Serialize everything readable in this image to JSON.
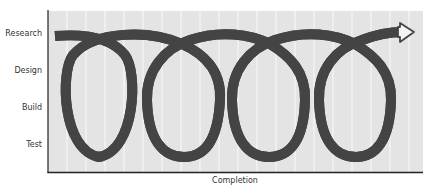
{
  "diagram": {
    "type": "iterative-spiral-process",
    "y_axis": {
      "labels": [
        "Research",
        "Design",
        "Build",
        "Test"
      ]
    },
    "x_axis": {
      "label": "Completion"
    },
    "loops": 4,
    "colors": {
      "background": "#e4e4e4",
      "stripe": "#f7f7f7",
      "band_fill": "#f4f4f4",
      "band_outline": "#444444",
      "axis": "#222222",
      "text": "#333333"
    }
  }
}
